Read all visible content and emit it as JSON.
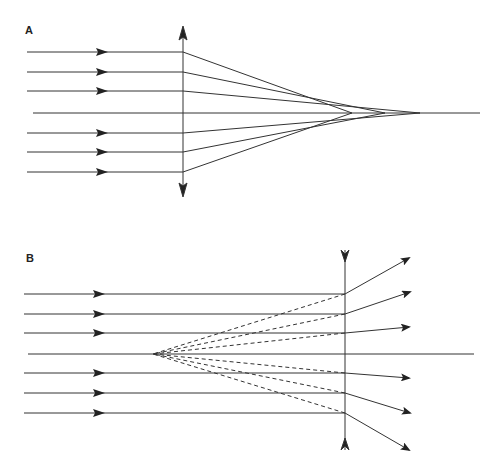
{
  "panels": [
    {
      "label": "A",
      "type": "converging-lens",
      "description": "Parallel rays converge after a convex lens"
    },
    {
      "label": "B",
      "type": "diverging-lens",
      "description": "Parallel rays diverge after a concave lens, appearing to come from a virtual focus"
    }
  ],
  "colors": {
    "line": "#333333",
    "background": "#ffffff"
  }
}
